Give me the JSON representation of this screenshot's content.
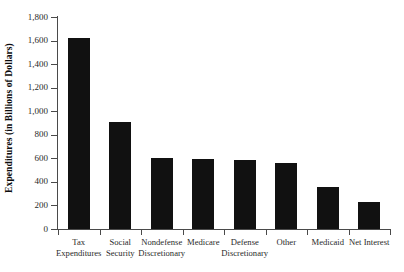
{
  "chart_data": {
    "type": "bar",
    "title": "",
    "xlabel": "",
    "ylabel": "Expenditures (in Billions of Dollars)",
    "ylim": [
      0,
      1800
    ],
    "ytick_labels": [
      "0",
      "200",
      "400",
      "600",
      "800",
      "1,000",
      "1,200",
      "1,400",
      "1,600",
      "1,800"
    ],
    "ytick_values": [
      0,
      200,
      400,
      600,
      800,
      1000,
      1200,
      1400,
      1600,
      1800
    ],
    "grid": false,
    "legend": null,
    "bar_color": "#111111",
    "categories": [
      "Tax\nExpenditures",
      "Social\nSecurity",
      "Nondefense\nDiscretionary",
      "Medicare",
      "Defense\nDiscretionary",
      "Other",
      "Medicaid",
      "Net Interest"
    ],
    "values": [
      1625,
      905,
      600,
      595,
      585,
      560,
      355,
      230
    ]
  }
}
